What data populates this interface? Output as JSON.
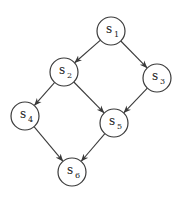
{
  "diagram": {
    "type": "directed-graph",
    "nodes": [
      {
        "id": "s1",
        "label": "s",
        "sub": "1",
        "x": 111,
        "y": 31
      },
      {
        "id": "s2",
        "label": "s",
        "sub": "2",
        "x": 64,
        "y": 72
      },
      {
        "id": "s3",
        "label": "s",
        "sub": "3",
        "x": 157,
        "y": 78
      },
      {
        "id": "s4",
        "label": "s",
        "sub": "4",
        "x": 25,
        "y": 116
      },
      {
        "id": "s5",
        "label": "s",
        "sub": "5",
        "x": 114,
        "y": 123
      },
      {
        "id": "s6",
        "label": "s",
        "sub": "6",
        "x": 72,
        "y": 172
      }
    ],
    "edges": [
      {
        "from": "s1",
        "to": "s2"
      },
      {
        "from": "s1",
        "to": "s3"
      },
      {
        "from": "s2",
        "to": "s4"
      },
      {
        "from": "s2",
        "to": "s5"
      },
      {
        "from": "s3",
        "to": "s5"
      },
      {
        "from": "s4",
        "to": "s6"
      },
      {
        "from": "s5",
        "to": "s6"
      }
    ],
    "node_radius": 14,
    "stroke_color": "#3a3a3a"
  }
}
